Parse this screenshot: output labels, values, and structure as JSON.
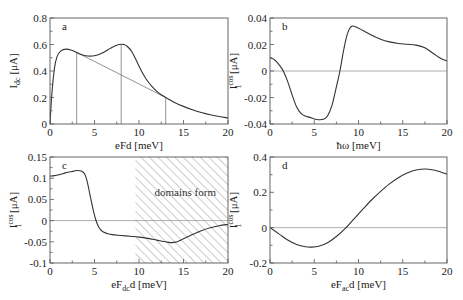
{
  "colors": {
    "curve": "#333333",
    "frame": "#555555",
    "zero_line": "#999999",
    "aux_line": "#777777",
    "hatch": "#9a9a9a"
  },
  "chart_data": [
    {
      "id": "a",
      "type": "line",
      "panel_letter": "a",
      "xlabel": "eFd [meV]",
      "ylabel": "I_dc [μA]",
      "ylabel_main": "I",
      "ylabel_sub": "dc",
      "ylabel_unit": " [μA]",
      "xlim": [
        0,
        20
      ],
      "ylim": [
        0,
        0.8
      ],
      "xticks": [
        0,
        5,
        10,
        15,
        20
      ],
      "yticks": [
        0,
        0.2,
        0.4,
        0.6,
        0.8
      ],
      "ytick_labels": [
        "0",
        "0.2",
        "0.4",
        "0.6",
        "0.8"
      ],
      "zero_line": false,
      "box": {
        "left": 50,
        "top": 18,
        "right": 228,
        "bottom": 124
      },
      "series": [
        {
          "name": "I_dc",
          "x": [
            0,
            0.2,
            0.5,
            0.8,
            1.2,
            1.8,
            2.5,
            3.0,
            3.5,
            4.0,
            4.5,
            5.0,
            5.5,
            6.0,
            6.5,
            7.0,
            7.5,
            8.0,
            8.3,
            8.7,
            9.2,
            9.7,
            10.2,
            10.8,
            11.5,
            12.2,
            13.0,
            14.0,
            15.0,
            16.0,
            17.0,
            18.0,
            19.0,
            20.0
          ],
          "y": [
            0,
            0.22,
            0.42,
            0.51,
            0.55,
            0.565,
            0.555,
            0.54,
            0.525,
            0.515,
            0.512,
            0.515,
            0.525,
            0.54,
            0.56,
            0.58,
            0.595,
            0.602,
            0.6,
            0.585,
            0.545,
            0.48,
            0.41,
            0.34,
            0.28,
            0.235,
            0.2,
            0.163,
            0.133,
            0.108,
            0.087,
            0.07,
            0.056,
            0.046
          ]
        }
      ],
      "vertical_lines": [
        {
          "x": 3,
          "y_top": 0.54
        },
        {
          "x": 8,
          "y_top": 0.6
        },
        {
          "x": 13,
          "y_top": 0.2
        }
      ],
      "straight_line": {
        "x": [
          3,
          13
        ],
        "y": [
          0.54,
          0.2
        ]
      }
    },
    {
      "id": "b",
      "type": "line",
      "panel_letter": "b",
      "xlabel": "ħω [meV]",
      "ylabel": "I_1^cos [μA]",
      "ylabel_main": "I",
      "ylabel_sub": "1",
      "ylabel_sup": "cos",
      "ylabel_unit": " [μA]",
      "xlim": [
        0,
        20
      ],
      "ylim": [
        -0.04,
        0.04
      ],
      "xticks": [
        0,
        5,
        10,
        15,
        20
      ],
      "yticks": [
        -0.04,
        -0.02,
        0,
        0.02,
        0.04
      ],
      "ytick_labels": [
        "-0.04",
        "-0.02",
        "0",
        "0.02",
        "0.04"
      ],
      "zero_line": true,
      "box": {
        "left": 270,
        "top": 18,
        "right": 447,
        "bottom": 124
      },
      "series": [
        {
          "name": "I_1^cos",
          "x": [
            0,
            0.5,
            1.0,
            1.5,
            2.0,
            2.5,
            3.0,
            3.5,
            4.0,
            4.5,
            5.0,
            5.5,
            6.0,
            6.5,
            7.0,
            7.5,
            7.9,
            8.3,
            8.7,
            9.0,
            9.3,
            9.8,
            10.5,
            11.5,
            12.5,
            13.5,
            14.5,
            15.5,
            16.5,
            17.5,
            18.5,
            19.3,
            20.0
          ],
          "y": [
            0.01,
            0.0085,
            0.005,
            0.0,
            -0.008,
            -0.018,
            -0.027,
            -0.032,
            -0.034,
            -0.035,
            -0.0362,
            -0.0368,
            -0.0365,
            -0.034,
            -0.026,
            -0.012,
            0.0,
            0.015,
            0.027,
            0.032,
            0.034,
            0.033,
            0.0305,
            0.027,
            0.024,
            0.022,
            0.0208,
            0.0202,
            0.0195,
            0.0175,
            0.013,
            0.0095,
            0.0075
          ]
        }
      ]
    },
    {
      "id": "c",
      "type": "line",
      "panel_letter": "c",
      "xlabel": "eF_dc d [meV]",
      "xlabel_pre": "eF",
      "xlabel_sub": "dc",
      "xlabel_post": "d [meV]",
      "ylabel": "I_1^cos [μA]",
      "ylabel_main": "I",
      "ylabel_sub": "1",
      "ylabel_sup": "cos",
      "ylabel_unit": " [μA]",
      "xlim": [
        0,
        20
      ],
      "ylim": [
        -0.1,
        0.15
      ],
      "xticks": [
        0,
        5,
        10,
        15,
        20
      ],
      "yticks": [
        -0.1,
        -0.05,
        0,
        0.05,
        0.1,
        0.15
      ],
      "ytick_labels": [
        "-0.1",
        "-0.05",
        "0",
        "0.05",
        "0.1",
        "0.15"
      ],
      "zero_line": true,
      "box": {
        "left": 50,
        "top": 157,
        "right": 228,
        "bottom": 263
      },
      "hatched_region": {
        "x_start": 9.6,
        "x_end": 20,
        "label": "domains form",
        "label_x": 15.2,
        "label_y": 0.059
      },
      "series": [
        {
          "name": "I_1^cos",
          "x": [
            0,
            0.5,
            1.0,
            1.5,
            2.0,
            2.5,
            3.0,
            3.5,
            3.9,
            4.2,
            4.5,
            4.8,
            5.1,
            5.4,
            5.7,
            6.0,
            6.5,
            7.0,
            8.0,
            9.0,
            10.0,
            11.0,
            12.0,
            13.0,
            13.7,
            14.3,
            15.0,
            16.0,
            17.0,
            18.0,
            19.0,
            20.0
          ],
          "y": [
            0.105,
            0.106,
            0.108,
            0.111,
            0.114,
            0.116,
            0.118,
            0.117,
            0.11,
            0.09,
            0.06,
            0.03,
            0.005,
            -0.012,
            -0.022,
            -0.027,
            -0.031,
            -0.033,
            -0.035,
            -0.037,
            -0.039,
            -0.042,
            -0.046,
            -0.05,
            -0.052,
            -0.05,
            -0.043,
            -0.033,
            -0.024,
            -0.017,
            -0.012,
            -0.009
          ]
        }
      ]
    },
    {
      "id": "d",
      "type": "line",
      "panel_letter": "d",
      "xlabel": "eF_ac d [meV]",
      "xlabel_pre": "eF",
      "xlabel_sub": "ac",
      "xlabel_post": "d [meV]",
      "ylabel": "I_1^cos [μA]",
      "ylabel_main": "I",
      "ylabel_sub": "1",
      "ylabel_sup": "cos",
      "ylabel_unit": " [μA]",
      "xlim": [
        0,
        20
      ],
      "ylim": [
        -0.2,
        0.4
      ],
      "xticks": [
        0,
        5,
        10,
        15,
        20
      ],
      "yticks": [
        -0.2,
        0,
        0.2,
        0.4
      ],
      "ytick_labels": [
        "-0.2",
        "0",
        "0.2",
        "0.4"
      ],
      "zero_line": true,
      "box": {
        "left": 270,
        "top": 157,
        "right": 447,
        "bottom": 263
      },
      "series": [
        {
          "name": "I_1^cos",
          "x": [
            0,
            1,
            2,
            3,
            4,
            4.7,
            5.5,
            6.5,
            7.5,
            8.6,
            9.5,
            10.5,
            11.5,
            12.5,
            13.5,
            14.5,
            15.5,
            16.5,
            17.5,
            18.5,
            19.3,
            20
          ],
          "y": [
            0,
            -0.035,
            -0.07,
            -0.095,
            -0.108,
            -0.11,
            -0.105,
            -0.085,
            -0.05,
            0.0,
            0.05,
            0.105,
            0.158,
            0.205,
            0.248,
            0.283,
            0.31,
            0.326,
            0.332,
            0.326,
            0.315,
            0.302
          ]
        }
      ]
    }
  ]
}
